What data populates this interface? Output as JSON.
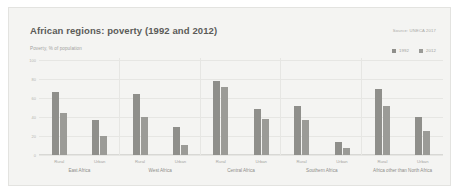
{
  "card": {
    "title": "African regions: poverty (1992 and 2012)",
    "source": "Source: UNECA 2017",
    "subtitle": "Poverty, % of population"
  },
  "legend": {
    "position": "top-right",
    "items": [
      {
        "label": "1992",
        "color": "#8f8f8b",
        "icon": "square-swatch"
      },
      {
        "label": "2012",
        "color": "#9b9b97",
        "icon": "square-swatch"
      }
    ]
  },
  "chart_data": {
    "type": "bar",
    "title": "African regions: poverty (1992 and 2012)",
    "subtitle": "Poverty, % of population",
    "source": "Source: UNECA 2017",
    "xlabel": "",
    "ylabel": "Poverty, % of population",
    "ylim": [
      0,
      100
    ],
    "yticks": [
      0,
      20,
      40,
      60,
      80,
      100
    ],
    "ytick_labels": [
      "0",
      "20",
      "40",
      "60",
      "80",
      "100"
    ],
    "grid": true,
    "legend": [
      "1992",
      "2012"
    ],
    "categories": [
      "East Africa - Rural",
      "East Africa - Urban",
      "West Africa - Rural",
      "West Africa - Urban",
      "Central Africa - Rural",
      "Central Africa - Urban",
      "Southern Africa - Rural",
      "Southern Africa - Urban",
      "Africa other than North Africa - Rural",
      "Africa other than North Africa - Urban"
    ],
    "series": [
      {
        "name": "1992",
        "values": [
          66,
          37,
          64,
          30,
          78,
          48,
          52,
          14,
          69,
          40
        ]
      },
      {
        "name": "2012",
        "values": [
          44,
          20,
          40,
          11,
          72,
          38,
          37,
          7,
          52,
          25
        ]
      }
    ],
    "groups": [
      {
        "label": "East Africa",
        "sub": [
          {
            "label": "Rural",
            "bars": [
              {
                "year": "1992",
                "value": 66
              },
              {
                "year": "2012",
                "value": 44
              }
            ]
          },
          {
            "label": "Urban",
            "bars": [
              {
                "year": "1992",
                "value": 37
              },
              {
                "year": "2012",
                "value": 20
              }
            ]
          }
        ]
      },
      {
        "label": "West Africa",
        "sub": [
          {
            "label": "Rural",
            "bars": [
              {
                "year": "1992",
                "value": 64
              },
              {
                "year": "2012",
                "value": 40
              }
            ]
          },
          {
            "label": "Urban",
            "bars": [
              {
                "year": "1992",
                "value": 30
              },
              {
                "year": "2012",
                "value": 11
              }
            ]
          }
        ]
      },
      {
        "label": "Central Africa",
        "sub": [
          {
            "label": "Rural",
            "bars": [
              {
                "year": "1992",
                "value": 78
              },
              {
                "year": "2012",
                "value": 72
              }
            ]
          },
          {
            "label": "Urban",
            "bars": [
              {
                "year": "1992",
                "value": 48
              },
              {
                "year": "2012",
                "value": 38
              }
            ]
          }
        ]
      },
      {
        "label": "Southern Africa",
        "sub": [
          {
            "label": "Rural",
            "bars": [
              {
                "year": "1992",
                "value": 52
              },
              {
                "year": "2012",
                "value": 37
              }
            ]
          },
          {
            "label": "Urban",
            "bars": [
              {
                "year": "1992",
                "value": 14
              },
              {
                "year": "2012",
                "value": 7
              }
            ]
          }
        ]
      },
      {
        "label": "Africa other than North Africa",
        "sub": [
          {
            "label": "Rural",
            "bars": [
              {
                "year": "1992",
                "value": 69
              },
              {
                "year": "2012",
                "value": 52
              }
            ]
          },
          {
            "label": "Urban",
            "bars": [
              {
                "year": "1992",
                "value": 40
              },
              {
                "year": "2012",
                "value": 25
              }
            ]
          }
        ]
      }
    ],
    "colors": {
      "series_1992": "#8f8f8b",
      "series_2012": "#9b9b97",
      "grid": "#e6e6e3",
      "card": "#f4f4f2"
    }
  }
}
